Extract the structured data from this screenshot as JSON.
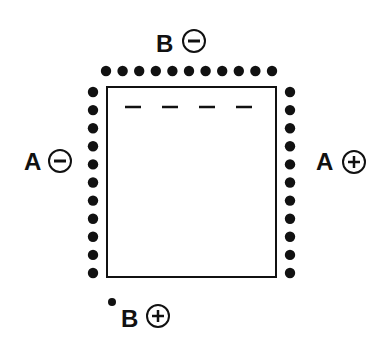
{
  "diagram": {
    "labels": {
      "top": {
        "letter": "B",
        "sign": "−",
        "polarity": "minus"
      },
      "left": {
        "letter": "A",
        "sign": "−",
        "polarity": "minus"
      },
      "right": {
        "letter": "A",
        "sign": "+",
        "polarity": "plus"
      },
      "bottom": {
        "letter": "B",
        "sign": "+",
        "polarity": "plus"
      }
    },
    "dots": {
      "top_row_count": 11,
      "left_column_count": 11,
      "right_column_count": 11,
      "bottom_single_count": 1
    },
    "panel": {
      "dash_count": 4
    },
    "colors": {
      "ink": "#111111",
      "background": "#ffffff"
    }
  }
}
